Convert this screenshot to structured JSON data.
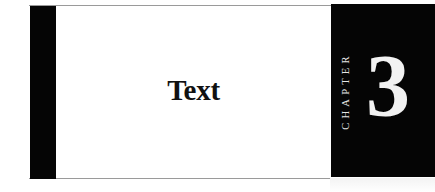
{
  "page": {
    "title": "Text",
    "chapter_label": "CHAPTER",
    "chapter_number": "3"
  },
  "colors": {
    "background": "#ffffff",
    "block": "#050505",
    "title_text": "#111111",
    "chapter_text": "#f2f2f2",
    "rule": "#9a9a9a"
  }
}
